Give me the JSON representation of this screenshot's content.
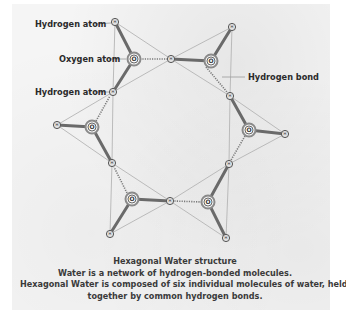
{
  "labels": {
    "hydrogen_atom_top": "Hydrogen atom",
    "oxygen_atom": "Oxygen atom",
    "hydrogen_atom_mid": "Hydrogen atom",
    "hydrogen_bond": "Hydrogen bond"
  },
  "atom_symbols": {
    "oxygen": "O",
    "hydrogen": "H"
  },
  "caption": {
    "title": "Hexagonal Water structure",
    "line1": "Water is a network of hydrogen-bonded molecules.",
    "line2": "Hexagonal Water is composed of six individual molecules of water, held",
    "line3": "together by common hydrogen bonds."
  },
  "colors": {
    "covalent_bond": "#6e6e6e",
    "hydrogen_bond": "#8a8a8a",
    "outline": "#b0b0b0",
    "text": "#2a2a2a"
  },
  "molecules": [
    {
      "O": [
        134,
        59
      ],
      "H": [
        [
          115,
          22
        ],
        [
          113,
          92
        ]
      ]
    },
    {
      "O": [
        211,
        61
      ],
      "H": [
        [
          232,
          27
        ],
        [
          171,
          59
        ]
      ]
    },
    {
      "O": [
        249,
        130
      ],
      "H": [
        [
          230,
          96
        ],
        [
          285,
          134
        ]
      ]
    },
    {
      "O": [
        208,
        202
      ],
      "H": [
        [
          229,
          164
        ],
        [
          226,
          238
        ]
      ]
    },
    {
      "O": [
        132,
        199
      ],
      "H": [
        [
          170,
          201
        ],
        [
          110,
          234
        ]
      ]
    },
    {
      "O": [
        92,
        127
      ],
      "H": [
        [
          57,
          125
        ],
        [
          112,
          163
        ]
      ]
    }
  ]
}
